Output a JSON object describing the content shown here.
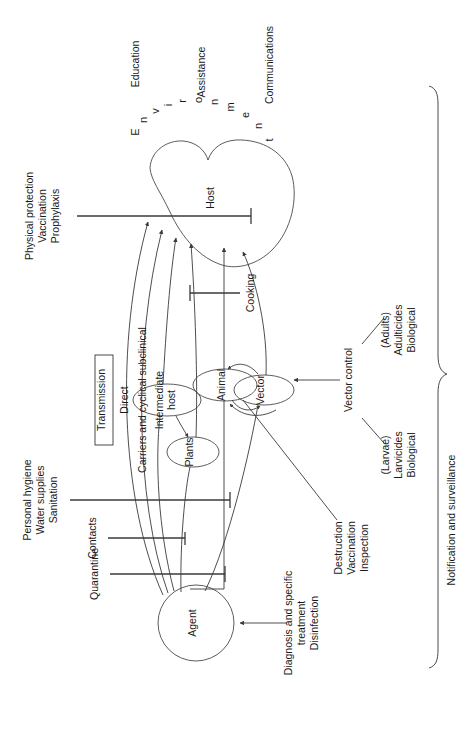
{
  "figure": {
    "orientation": "rotated-90-ccw",
    "legend_box_label": "Transmission",
    "nodes": {
      "agent": "Agent",
      "host": "Host",
      "plants": "Plants",
      "intermediate_host": "Intermediate\nhost",
      "intermediate_host_line1": "Intermediate",
      "intermediate_host_line2": "host",
      "animal": "Animal",
      "vector": "Vector"
    },
    "environment_label": "Environment",
    "environment_letters": [
      "E",
      "n",
      "v",
      "i",
      "r",
      "o",
      "n",
      "m",
      "e",
      "n",
      "t"
    ],
    "transmission_routes": [
      "Direct",
      "Carriers and cyclical subclinical"
    ],
    "interventions": {
      "host_protection": {
        "lines": [
          "Physical protection",
          "Vaccination",
          "Prophylaxis"
        ]
      },
      "environment_top": {
        "lines": [
          "Education",
          "Assistance",
          "Communications"
        ],
        "education": "Education",
        "assistance": "Assistance",
        "communications": "Communications"
      },
      "cooking": {
        "label": "Cooking"
      },
      "sanitation": {
        "lines": [
          "Personal hygiene",
          "Water supplies",
          "Sanitation"
        ]
      },
      "contacts": {
        "label": "Contacts"
      },
      "quarantine": {
        "label": "Quarantine"
      },
      "agent_treatment": {
        "lines": [
          "Diagnosis and specific",
          "treatment",
          "Disinfection"
        ]
      },
      "animal_control": {
        "lines": [
          "Destruction",
          "Vaccination",
          "Inspection"
        ]
      },
      "vector_control": {
        "label": "Vector control",
        "branches": [
          {
            "lines": [
              "(Larvae)",
              "Larvicides",
              "Biological"
            ]
          },
          {
            "lines": [
              "(Adults)",
              "Adulticides",
              "Biological"
            ]
          }
        ]
      },
      "surveillance": {
        "label": "Notification and surveillance"
      }
    },
    "colors": {
      "stroke": "#3a3a3a",
      "node_stroke": "#4a4a4a",
      "text": "#1a1a1a",
      "background": "#ffffff"
    }
  }
}
